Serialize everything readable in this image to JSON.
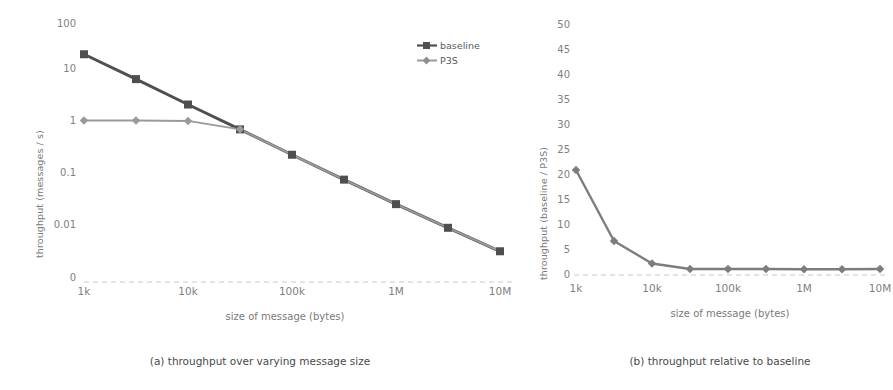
{
  "figure": {
    "background": "#ffffff",
    "ink_dark": "#4f4f4f",
    "ink_light": "#9a9a9a",
    "tick_color": "#808080"
  },
  "panel_a": {
    "caption": "(a) throughput  over varying message size",
    "legend": [
      {
        "name": "baseline",
        "color": "#4f4f4f",
        "marker": "square"
      },
      {
        "name": "P3S",
        "color": "#9a9a9a",
        "marker": "diamond"
      }
    ]
  },
  "panel_b": {
    "caption": "(b) throughput relative to baseline"
  },
  "chart_data": [
    {
      "id": "panel-a",
      "type": "line",
      "title": "",
      "xlabel": "size of message (bytes)",
      "ylabel": "throughput (messages / s)",
      "xscale": "category",
      "yscale": "log",
      "grid": false,
      "legend_position": "top-right",
      "categories": [
        "1k",
        "3k",
        "10k",
        "30k",
        "100k",
        "300k",
        "1M",
        "3M",
        "10M"
      ],
      "ytick_labels": [
        "100",
        "10",
        "1",
        "0.1",
        "0.01",
        "0"
      ],
      "ytick_values": [
        100,
        10,
        1,
        0.1,
        0.01,
        0
      ],
      "ylim": [
        0.01,
        100
      ],
      "series": [
        {
          "name": "baseline",
          "color": "#4f4f4f",
          "marker": "square",
          "values": [
            25,
            8,
            2.5,
            0.8,
            0.25,
            0.08,
            0.026,
            0.0088,
            0.003
          ]
        },
        {
          "name": "P3S",
          "color": "#9a9a9a",
          "marker": "diamond",
          "values": [
            1.2,
            1.2,
            1.18,
            0.8,
            0.25,
            0.08,
            0.026,
            0.0088,
            0.003
          ]
        }
      ]
    },
    {
      "id": "panel-b",
      "type": "line",
      "title": "",
      "xlabel": "size of message (bytes)",
      "ylabel": "throughput (baseline / P3S)",
      "xscale": "category",
      "yscale": "linear",
      "grid": false,
      "legend_position": "none",
      "categories": [
        "1k",
        "3k",
        "10k",
        "30k",
        "100k",
        "300k",
        "1M",
        "3M",
        "10M"
      ],
      "ytick_labels": [
        "50",
        "45",
        "40",
        "35",
        "30",
        "25",
        "20",
        "15",
        "10",
        "5",
        "0"
      ],
      "ytick_values": [
        50,
        45,
        40,
        35,
        30,
        25,
        20,
        15,
        10,
        5,
        0
      ],
      "ylim": [
        0,
        50
      ],
      "series": [
        {
          "name": "baseline / P3S",
          "color": "#7d7d7d",
          "marker": "diamond",
          "values": [
            21,
            6.8,
            2.3,
            1.2,
            1.2,
            1.2,
            1.15,
            1.15,
            1.2
          ]
        }
      ]
    }
  ]
}
